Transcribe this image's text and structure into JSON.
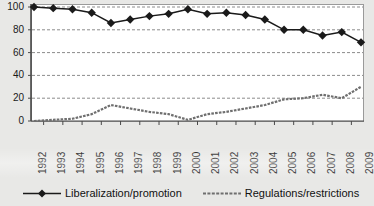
{
  "chart_data": {
    "type": "line",
    "title": "",
    "subtitle": "",
    "xlabel": "",
    "ylabel": "",
    "xlim": [
      1992,
      2009
    ],
    "ylim": [
      0,
      100
    ],
    "yticks": [
      0,
      20,
      40,
      60,
      80,
      100
    ],
    "grid": "horizontal-dashed",
    "legend_position": "bottom",
    "categories": [
      "1992",
      "1993",
      "1994",
      "1995",
      "1996",
      "1997",
      "1998",
      "1999",
      "2000",
      "2001",
      "2002",
      "2003",
      "2004",
      "2005",
      "2006",
      "2007",
      "2008",
      "2009"
    ],
    "series": [
      {
        "name": "Liberalization/promotion",
        "marker": "diamond",
        "color": "#1a1a1a",
        "values": [
          100,
          99,
          98,
          95,
          86,
          89,
          92,
          94,
          98,
          94,
          95,
          93,
          89,
          80,
          80,
          75,
          78,
          69
        ]
      },
      {
        "name": "Regulations/restrictions",
        "marker": "none",
        "color": "#6f6f6f",
        "values": [
          0,
          1,
          2,
          6,
          14,
          11,
          8,
          6,
          1,
          6,
          8,
          11,
          14,
          19,
          20,
          23,
          20,
          30
        ]
      }
    ],
    "annotations": []
  },
  "axis": {
    "y_tick_labels": [
      "100",
      "80",
      "60",
      "40",
      "20",
      "0"
    ],
    "x_tick_labels": [
      "1992",
      "1993",
      "1994",
      "1995",
      "1996",
      "1997",
      "1998",
      "1999",
      "2000",
      "2001",
      "2002",
      "2003",
      "2004",
      "2005",
      "2006",
      "2007",
      "2008",
      "2009"
    ]
  },
  "legend": {
    "items": [
      {
        "label": "Liberalization/promotion",
        "style": "solid-with-diamond-marker",
        "color": "#1a1a1a"
      },
      {
        "label": "Regulations/restrictions",
        "style": "dashed",
        "color": "#6f6f6f"
      }
    ]
  },
  "colors": {
    "background": "#e8e8e6",
    "plot_background": "#ffffff",
    "frame": "#9a9a9a",
    "gridline": "#8c8c8c",
    "series_liberalization": "#1a1a1a",
    "series_regulations": "#6f6f6f",
    "text": "#1a1a1a"
  }
}
